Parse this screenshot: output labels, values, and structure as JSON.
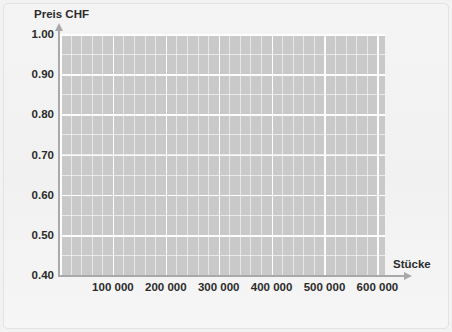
{
  "chart_data": {
    "type": "line",
    "title": "",
    "xlabel": "Stücke",
    "ylabel": "Preis CHF",
    "xlim": [
      0,
      620000
    ],
    "ylim": [
      0.38,
      1.0
    ],
    "grid": true,
    "legend": null,
    "series": [],
    "x_ticks": [
      {
        "value": 100000,
        "label": "100 000"
      },
      {
        "value": 200000,
        "label": "200 000"
      },
      {
        "value": 300000,
        "label": "300 000"
      },
      {
        "value": 400000,
        "label": "400 000"
      },
      {
        "value": 500000,
        "label": "500 000"
      },
      {
        "value": 600000,
        "label": "600 000"
      }
    ],
    "y_ticks": [
      {
        "value": 1.0,
        "label": "1.00"
      },
      {
        "value": 0.9,
        "label": "0.90"
      },
      {
        "value": 0.8,
        "label": "0.80"
      },
      {
        "value": 0.7,
        "label": "0.70"
      },
      {
        "value": 0.6,
        "label": "0.60"
      },
      {
        "value": 0.5,
        "label": "0.50"
      },
      {
        "value": 0.4,
        "label": "0.40"
      }
    ],
    "x_major_step": 100000,
    "x_minor_step": 20000,
    "y_major_step": 0.1,
    "y_minor_step": 0.05,
    "colors": {
      "plot_background": "#c9c9c9",
      "gridline": "#ffffff",
      "axis": "#a9a9a9",
      "text": "#2b2b2b",
      "figure_background": "#f3f3f3",
      "frame_border": "#e2e2e2"
    }
  }
}
